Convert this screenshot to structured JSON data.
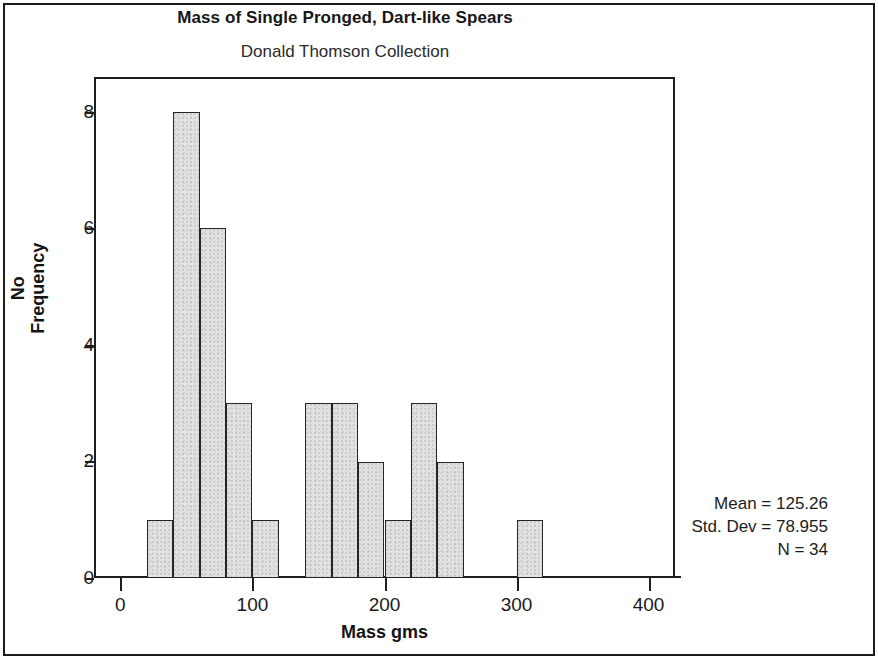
{
  "figure": {
    "title": "Mass of Single Pronged, Dart-like Spears",
    "subtitle": "Donald Thomson Collection"
  },
  "stats": {
    "mean": "Mean = 125.26",
    "std_dev": "Std. Dev = 78.955",
    "n": "N = 34"
  },
  "axes": {
    "ylabel_line1": "No",
    "ylabel_line2": "Frequency",
    "xlabel": "Mass gms",
    "yticks": [
      "0",
      "2",
      "4",
      "6",
      "8"
    ],
    "xticks": [
      "0",
      "100",
      "200",
      "300",
      "400"
    ]
  },
  "chart_data": {
    "type": "bar",
    "title": "Mass of Single Pronged, Dart-like Spears",
    "subtitle": "Donald Thomson Collection",
    "xlabel": "Mass gms",
    "ylabel": "No Frequency",
    "xlim": [
      -20,
      420
    ],
    "ylim": [
      0,
      8.6
    ],
    "grid": false,
    "legend": "none",
    "bin_width": 20,
    "bin_starts": [
      20,
      40,
      60,
      80,
      100,
      140,
      160,
      180,
      200,
      220,
      240,
      300
    ],
    "categories": [
      "20-40",
      "40-60",
      "60-80",
      "80-100",
      "100-120",
      "140-160",
      "160-180",
      "180-200",
      "200-220",
      "220-240",
      "240-260",
      "300-320"
    ],
    "values": [
      1,
      8,
      6,
      3,
      1,
      3,
      3,
      2,
      1,
      3,
      2,
      1
    ],
    "annotations": [
      "Mean = 125.26",
      "Std. Dev = 78.955",
      "N = 34"
    ]
  }
}
